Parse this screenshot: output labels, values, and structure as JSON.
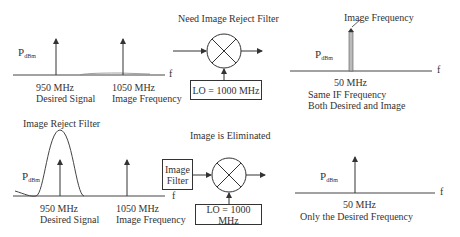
{
  "top_left_spectrum": {
    "y_label_main": "P",
    "y_label_sub": "dBm",
    "x_axis_label": "f",
    "signals": [
      {
        "freq": "950 MHz",
        "desc": "Desired Signal"
      },
      {
        "freq": "1050 MHz",
        "desc": "Image Frequency"
      }
    ]
  },
  "top_mixer": {
    "title": "Need Image Reject Filter",
    "lo_label": "LO = 1000 MHz"
  },
  "top_right_spectrum": {
    "annotation": "Image Frequency",
    "y_label_main": "P",
    "y_label_sub": "dBm",
    "x_axis_label": "f",
    "freq": "50 MHz",
    "desc_line1": "Same IF Frequency",
    "desc_line2": "Both Desired and Image"
  },
  "bottom_left_spectrum": {
    "filter_label": "Image Reject Filter",
    "y_label_main": "P",
    "y_label_sub": "dBm",
    "x_axis_label": "f",
    "signals": [
      {
        "freq": "950 MHz",
        "desc": "Desired Signal"
      },
      {
        "freq": "1050 MHz",
        "desc": "Image Frequency"
      }
    ]
  },
  "bottom_mixer": {
    "title": "Image is Eliminated",
    "filter_box_line1": "Image",
    "filter_box_line2": "Filter",
    "lo_label": "LO = 1000 MHz"
  },
  "bottom_right_spectrum": {
    "y_label_main": "P",
    "y_label_sub": "dBm",
    "x_axis_label": "f",
    "freq": "50 MHz",
    "desc": "Only the Desired Frequency"
  },
  "colors": {
    "line": "#333333",
    "text": "#333333",
    "background": "#ffffff"
  }
}
